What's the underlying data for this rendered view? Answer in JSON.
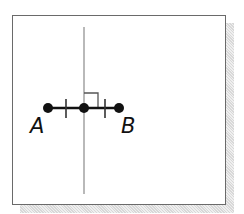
{
  "figure": {
    "type": "geometry-perpendicular-bisector",
    "points": [
      {
        "name": "A",
        "label": "A",
        "x": 48,
        "y": 108
      },
      {
        "name": "M",
        "label": "",
        "x": 84,
        "y": 108
      },
      {
        "name": "B",
        "label": "B",
        "x": 119,
        "y": 108
      }
    ],
    "segment": {
      "from": "A",
      "to": "B"
    },
    "tick_marks": [
      {
        "x": 66,
        "y": 108
      },
      {
        "x": 105,
        "y": 108
      }
    ],
    "perpendicular_line": {
      "x": 84,
      "y_start": 27,
      "y_end": 194
    },
    "right_angle_marker": {
      "x": 84,
      "y": 108,
      "size": 14
    },
    "colors": {
      "ink": "#111111",
      "bisector": "#8a8a8a",
      "frame_border": "#6a6a6a",
      "shadow": "#d8d8d8"
    }
  }
}
